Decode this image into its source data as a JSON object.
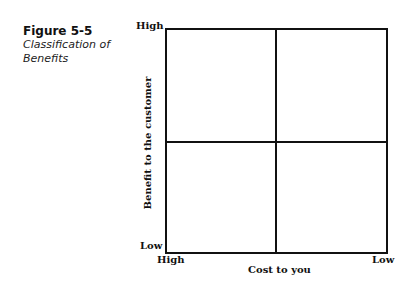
{
  "figure": {
    "number": "Figure 5-5",
    "title_line1": "Classification of",
    "title_line2": "Benefits"
  },
  "axes": {
    "y_label": "Benefit to the customer",
    "y_high": "High",
    "y_low": "Low",
    "x_label": "Cost to you",
    "x_high": "High",
    "x_low": "Low"
  }
}
